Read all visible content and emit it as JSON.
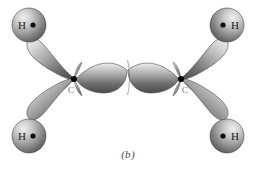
{
  "figure": {
    "caption": "(b)",
    "background_color": "#ffffff",
    "style": "grayscale airbrush orbital illustration"
  },
  "colors": {
    "lobe_light": "#e8e8e8",
    "lobe_mid": "#9a9a9a",
    "lobe_dark": "#4f4f4f",
    "sphere_light": "#dcdcdc",
    "sphere_mid": "#9d9d9d",
    "sphere_dark": "#565656",
    "outline": "#3c3c3c",
    "nucleus": "#101010",
    "label_text": "#1b1b1b",
    "caption_text": "#4a4a4a"
  },
  "molecule": {
    "name": "ethylene",
    "formula": "C2H4",
    "bond_shown": "sigma framework",
    "atoms": [
      {
        "id": "C1",
        "element": "C",
        "label": "C",
        "x": 74,
        "y": 79,
        "hybridization": "sp2"
      },
      {
        "id": "C2",
        "element": "C",
        "label": "C",
        "x": 181,
        "y": 79,
        "hybridization": "sp2"
      },
      {
        "id": "H1",
        "element": "H",
        "label": "H",
        "dot_side": "right",
        "x": 29,
        "y": 25,
        "radius": 17
      },
      {
        "id": "H2",
        "element": "H",
        "label": "H",
        "dot_side": "left",
        "x": 227,
        "y": 25,
        "radius": 17
      },
      {
        "id": "H3",
        "element": "H",
        "label": "H",
        "dot_side": "right",
        "x": 29,
        "y": 136,
        "radius": 17
      },
      {
        "id": "H4",
        "element": "H",
        "label": "H",
        "dot_side": "left",
        "x": 227,
        "y": 136,
        "radius": 17
      }
    ],
    "bonds": [
      {
        "id": "C1-H1",
        "type": "sigma",
        "from": "C1",
        "to": "H1",
        "orbital": "sp2-s"
      },
      {
        "id": "C1-H3",
        "type": "sigma",
        "from": "C1",
        "to": "H3",
        "orbital": "sp2-s"
      },
      {
        "id": "C2-H2",
        "type": "sigma",
        "from": "C2",
        "to": "H2",
        "orbital": "sp2-s"
      },
      {
        "id": "C2-H4",
        "type": "sigma",
        "from": "C2",
        "to": "H4",
        "orbital": "sp2-s"
      },
      {
        "id": "C1-C2",
        "type": "sigma",
        "from": "C1",
        "to": "C2",
        "orbital": "sp2-sp2"
      }
    ]
  },
  "labels": {
    "hydrogen_top_left": "H",
    "hydrogen_top_right": "H",
    "hydrogen_bottom_left": "H",
    "hydrogen_bottom_right": "H",
    "carbon_left": "C",
    "carbon_right": "C"
  },
  "icons": {
    "nucleus_dot": "nucleus-dot-icon"
  }
}
